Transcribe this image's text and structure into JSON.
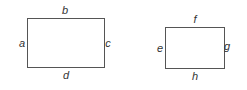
{
  "diagram": {
    "rectangles": [
      {
        "id": "rect-1",
        "labels": {
          "left": "a",
          "top": "b",
          "right": "c",
          "bottom": "d"
        }
      },
      {
        "id": "rect-2",
        "labels": {
          "left": "e",
          "top": "f",
          "right": "g",
          "bottom": "h"
        }
      }
    ]
  }
}
